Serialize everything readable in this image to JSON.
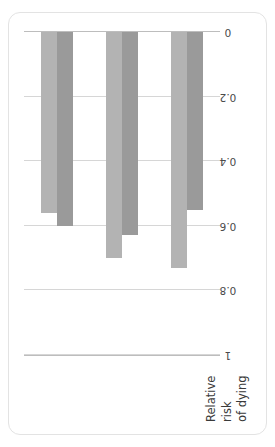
{
  "chart_data": {
    "type": "bar",
    "orientation": "horizontal",
    "title": "",
    "xlabel": "",
    "ylabel": "Relative risk of dying",
    "ylabel_lines": [
      "Relative",
      "risk",
      "of dying"
    ],
    "categories": [
      "Not smoking",
      "Regular exercise",
      "Weekly religious attendance"
    ],
    "category_lines": [
      [
        "Not smoking"
      ],
      [
        "Regular exercise"
      ],
      [
        "Weekly religious",
        "attendance"
      ]
    ],
    "series": [
      {
        "name": "Men",
        "color": "#b3b3b3",
        "values": [
          0.56,
          0.7,
          0.73
        ]
      },
      {
        "name": "Women",
        "color": "#9a9a9a",
        "values": [
          0.6,
          0.63,
          0.55
        ]
      }
    ],
    "value_axis": {
      "ticks": [
        1,
        0.8,
        0.6,
        0.4,
        0.2,
        0
      ],
      "tick_labels": [
        "1",
        "0.8",
        "0.6",
        "0.4",
        "0.2",
        "0"
      ],
      "min": 0,
      "max": 1,
      "reversed": true,
      "grid": true
    },
    "legend": {
      "position": "bottom-right",
      "entries": [
        {
          "label": "Men",
          "color": "#b3b3b3"
        },
        {
          "label": "Women",
          "color": "#9a9a9a"
        }
      ]
    },
    "colors": {
      "gridline": "#d6d6d6",
      "axis": "#bdbdbd",
      "frame": "#e3e3e3",
      "text": "#3a3a3a",
      "background": "#ffffff"
    }
  }
}
